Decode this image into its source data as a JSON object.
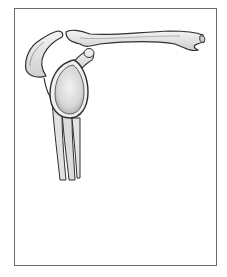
{
  "figure": {
    "parts": [
      {
        "id": "clavicle",
        "label": "Clavicle"
      },
      {
        "id": "acromion",
        "label": "Acromion"
      },
      {
        "id": "coracoid",
        "label": "Coracoid process"
      },
      {
        "id": "glenoid",
        "label": "Glenoid fossa"
      },
      {
        "id": "scapular-body",
        "label": "Scapular body"
      }
    ],
    "colors": {
      "border": "#6a6a6a",
      "bone_fill": "#e6e6e6",
      "bone_outline": "#333333",
      "glenoid_fill": "#d8d8d8",
      "background": "#ffffff"
    }
  }
}
